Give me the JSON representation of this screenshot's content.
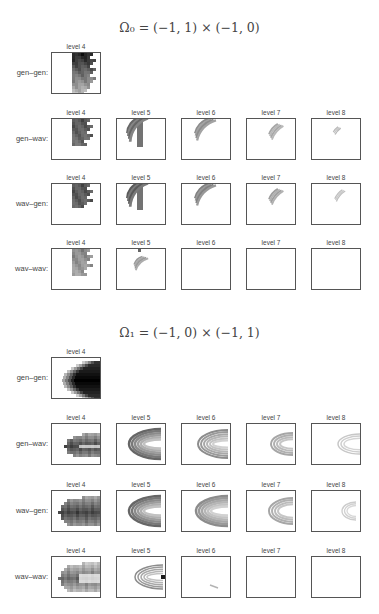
{
  "sections": [
    {
      "title": "Ω₀ = (−1, 1) × (−1, 0)",
      "rows": [
        {
          "label": "gen–gen:",
          "panels": [
            {
              "level": "level 4",
              "pattern": "o0_gg4"
            }
          ]
        },
        {
          "label": "gen–wav:",
          "panels": [
            {
              "level": "level 4",
              "pattern": "o0_gw4"
            },
            {
              "level": "level 5",
              "pattern": "o0_gw5"
            },
            {
              "level": "level 6",
              "pattern": "o0_gw6"
            },
            {
              "level": "level 7",
              "pattern": "o0_gw7"
            },
            {
              "level": "level 8",
              "pattern": "o0_gw8"
            }
          ]
        },
        {
          "label": "wav–gen:",
          "panels": [
            {
              "level": "level 4",
              "pattern": "o0_wg4"
            },
            {
              "level": "level 5",
              "pattern": "o0_wg5"
            },
            {
              "level": "level 6",
              "pattern": "o0_wg6"
            },
            {
              "level": "level 7",
              "pattern": "o0_wg7"
            },
            {
              "level": "level 8",
              "pattern": "o0_wg8"
            }
          ]
        },
        {
          "label": "wav–wav:",
          "panels": [
            {
              "level": "level 4",
              "pattern": "o0_ww4"
            },
            {
              "level": "level 5",
              "pattern": "o0_ww5"
            },
            {
              "level": "level 6",
              "pattern": "empty"
            },
            {
              "level": "level 7",
              "pattern": "empty"
            },
            {
              "level": "level 8",
              "pattern": "empty"
            }
          ]
        }
      ]
    },
    {
      "title": "Ω₁ = (−1, 0) × (−1, 1)",
      "rows": [
        {
          "label": "gen–gen:",
          "panels": [
            {
              "level": "level 4",
              "pattern": "o1_gg4"
            }
          ]
        },
        {
          "label": "gen–wav:",
          "panels": [
            {
              "level": "level 4",
              "pattern": "o1_gw4"
            },
            {
              "level": "level 5",
              "pattern": "o1_gw5"
            },
            {
              "level": "level 6",
              "pattern": "o1_gw6"
            },
            {
              "level": "level 7",
              "pattern": "o1_gw7"
            },
            {
              "level": "level 8",
              "pattern": "o1_gw8"
            }
          ]
        },
        {
          "label": "wav–gen:",
          "panels": [
            {
              "level": "level 4",
              "pattern": "o1_wg4"
            },
            {
              "level": "level 5",
              "pattern": "o1_wg5"
            },
            {
              "level": "level 6",
              "pattern": "o1_wg6"
            },
            {
              "level": "level 7",
              "pattern": "o1_wg7"
            },
            {
              "level": "level 8",
              "pattern": "o1_wg8"
            }
          ]
        },
        {
          "label": "wav–wav:",
          "panels": [
            {
              "level": "level 4",
              "pattern": "o1_ww4"
            },
            {
              "level": "level 5",
              "pattern": "o1_ww5"
            },
            {
              "level": "level 6",
              "pattern": "o1_ww6"
            },
            {
              "level": "level 7",
              "pattern": "empty"
            },
            {
              "level": "level 8",
              "pattern": "empty"
            }
          ]
        }
      ]
    }
  ],
  "chart_data": {
    "type": "heatmap",
    "subplots": [
      {
        "domain": "Ω0 = (−1,1) × (−1,0)",
        "row_labels": [
          "gen–gen:",
          "gen–wav:",
          "wav–gen:",
          "wav–wav:"
        ],
        "column_labels": [
          "level 4",
          "level 5",
          "level 6",
          "level 7",
          "level 8"
        ],
        "gen_gen_levels": [
          "level 4"
        ],
        "description": "Nonzero region concentrated in right half, arc-shaped band curving upward-right; intensity fades with increasing level; wav–wav empty for levels 6–8"
      },
      {
        "domain": "Ω1 = (−1,0) × (−1,1)",
        "row_labels": [
          "gen–gen:",
          "gen–wav:",
          "wav–gen:",
          "wav–wav:"
        ],
        "column_labels": [
          "level 4",
          "level 5",
          "level 6",
          "level 7",
          "level 8"
        ],
        "gen_gen_levels": [
          "level 4"
        ],
        "description": "Horseshoe/C-shaped band opening toward right edge; intensity fades with increasing level; wav–wav nearly empty for levels 6–8"
      }
    ],
    "colormap": "grayscale (white = 0, black = max)",
    "grid": false,
    "legend": null
  },
  "layout": {
    "section_title_y": [
      20,
      325
    ],
    "row_tops": [
      [
        52,
        118,
        183,
        248
      ],
      [
        357,
        423,
        490,
        556
      ]
    ],
    "col_lefts": [
      51,
      116,
      181,
      246,
      311
    ]
  }
}
